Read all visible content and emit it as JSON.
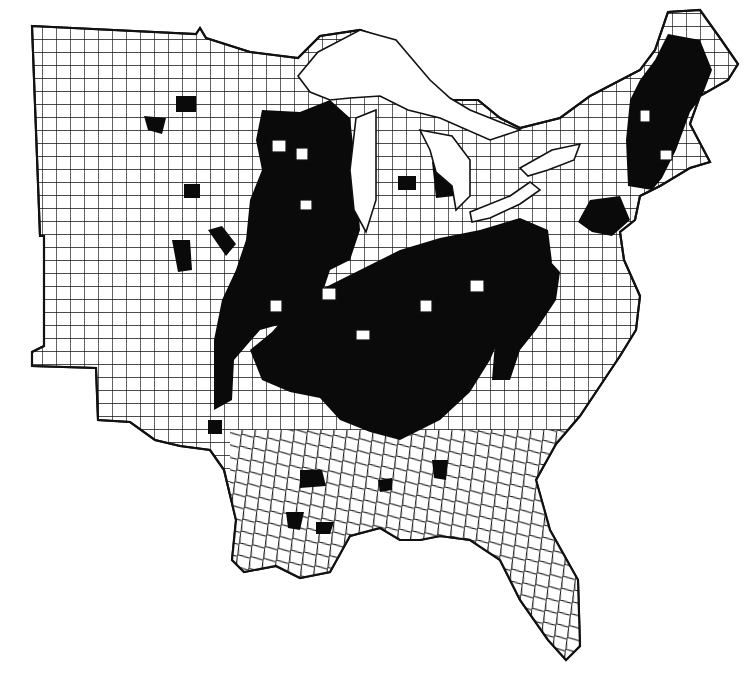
{
  "map": {
    "type": "choropleth",
    "region": "Eastern United States",
    "units": "counties",
    "background_color": "#ffffff",
    "boundary_color": "#111111",
    "shaded_color": "#0a0a0a",
    "unshaded_color": "#ffffff",
    "title": "",
    "legend": []
  },
  "shaded_regions": [
    {
      "name": "Upper Midwest / Wisconsin-Illinois band"
    },
    {
      "name": "Ohio Valley / Kentucky-Tennessee core"
    },
    {
      "name": "Appalachia / West Virginia-Virginia"
    },
    {
      "name": "Pennsylvania / New York corridor"
    },
    {
      "name": "New England / Maine-Vermont-New Hampshire"
    },
    {
      "name": "Scattered Minnesota and Iowa counties"
    },
    {
      "name": "Scattered Michigan counties"
    },
    {
      "name": "Scattered Arkansas, Louisiana, Mississippi, Georgia counties"
    }
  ]
}
